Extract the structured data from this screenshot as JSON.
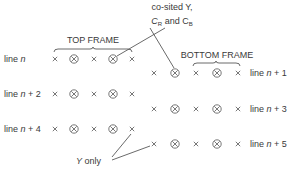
{
  "annotations": {
    "cosited_line1": "co-sited Y,",
    "cosited_c": "C",
    "cosited_r": "R",
    "cosited_and": " and C",
    "cosited_b": "B",
    "y_only_y": "Y",
    "y_only_rest": " only"
  },
  "frames": {
    "top": {
      "label": "TOP FRAME"
    },
    "bottom": {
      "label": "BOTTOM FRAME"
    }
  },
  "lines": {
    "top": [
      {
        "prefix": "line ",
        "var": "n",
        "suffix": ""
      },
      {
        "prefix": "line ",
        "var": "n",
        "suffix": " + 2"
      },
      {
        "prefix": "line ",
        "var": "n",
        "suffix": " + 4"
      }
    ],
    "bottom": [
      {
        "prefix": "line ",
        "var": "n",
        "suffix": " + 1"
      },
      {
        "prefix": "line ",
        "var": "n",
        "suffix": " + 3"
      },
      {
        "prefix": "line ",
        "var": "n",
        "suffix": " + 5"
      }
    ]
  },
  "sample_pattern": [
    "Y only",
    "co-sited Y, CR and CB",
    "Y only",
    "co-sited Y, CR and CB",
    "Y only"
  ],
  "legend_symbols": {
    "cross": "×",
    "circled_cross": "⊗"
  }
}
